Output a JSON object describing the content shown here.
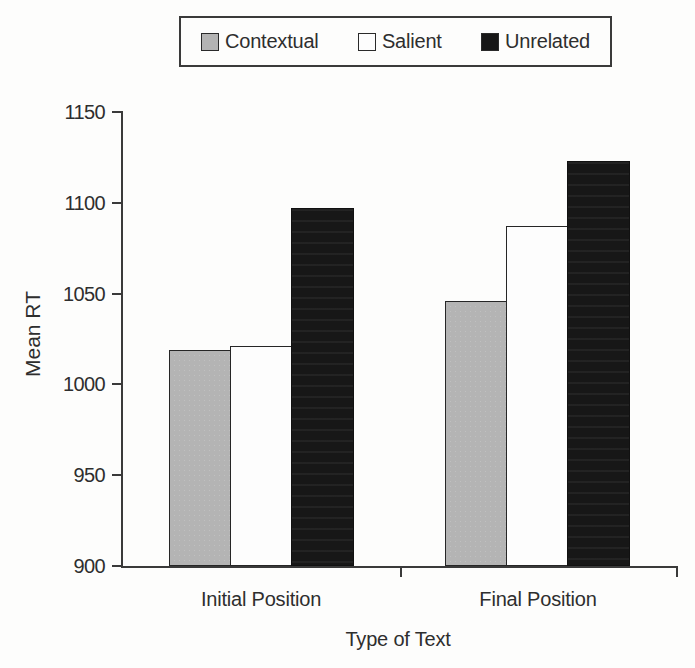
{
  "figure": {
    "background_color": "#fdfdfc",
    "ink_color": "#3a3a3a"
  },
  "chart_data": {
    "type": "bar",
    "title": "",
    "xlabel": "Type of Text",
    "ylabel": "Mean RT",
    "categories": [
      "Initial Position",
      "Final Position"
    ],
    "series": [
      {
        "name": "Contextual",
        "color": "#b4b4b4",
        "values": [
          1019,
          1046
        ]
      },
      {
        "name": "Salient",
        "color": "#fdfdfd",
        "values": [
          1021,
          1087
        ]
      },
      {
        "name": "Unrelated",
        "color": "#171717",
        "values": [
          1097,
          1123
        ]
      }
    ],
    "ylim": [
      900,
      1150
    ],
    "yticks": [
      900,
      950,
      1000,
      1050,
      1100,
      1150
    ],
    "grid": false,
    "legend_position": "top"
  }
}
